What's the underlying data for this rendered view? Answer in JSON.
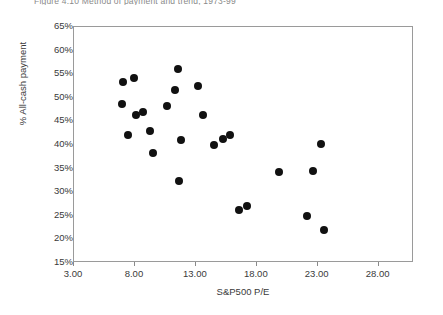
{
  "figure": {
    "title": "Figure 4.10    Method of payment and trend, 1973-99"
  },
  "chart_data": {
    "type": "scatter",
    "title": "Method of payment and trend, 1973-99",
    "xlabel": "S&P500 P/E",
    "ylabel": "% All-cash payment",
    "xlim": [
      3.0,
      30.9
    ],
    "ylim": [
      15,
      65
    ],
    "grid": false,
    "legend": "none",
    "marker": {
      "shape": "circle",
      "color": "#111111",
      "size_px": 8
    },
    "xticks": [
      "3.00",
      "8.00",
      "13.00",
      "18.00",
      "23.00",
      "28.00"
    ],
    "xtick_values": [
      3,
      8,
      13,
      18,
      23,
      28
    ],
    "yticks": [
      "15%",
      "20%",
      "25%",
      "30%",
      "35%",
      "40%",
      "45%",
      "50%",
      "55%",
      "60%",
      "65%"
    ],
    "ytick_values": [
      15,
      20,
      25,
      30,
      35,
      40,
      45,
      50,
      55,
      60,
      65
    ],
    "points": [
      {
        "x": 7.0,
        "y": 53.4
      },
      {
        "x": 7.9,
        "y": 54.3
      },
      {
        "x": 6.9,
        "y": 48.7
      },
      {
        "x": 7.4,
        "y": 42.2
      },
      {
        "x": 8.1,
        "y": 46.3
      },
      {
        "x": 8.7,
        "y": 47.0
      },
      {
        "x": 9.2,
        "y": 43.0
      },
      {
        "x": 9.5,
        "y": 38.2
      },
      {
        "x": 10.6,
        "y": 48.3
      },
      {
        "x": 11.5,
        "y": 56.2
      },
      {
        "x": 11.3,
        "y": 51.6
      },
      {
        "x": 11.8,
        "y": 41.1
      },
      {
        "x": 11.6,
        "y": 32.4
      },
      {
        "x": 13.2,
        "y": 52.4
      },
      {
        "x": 13.6,
        "y": 46.3
      },
      {
        "x": 14.5,
        "y": 40.1
      },
      {
        "x": 15.2,
        "y": 41.2
      },
      {
        "x": 15.8,
        "y": 42.1
      },
      {
        "x": 16.5,
        "y": 26.2
      },
      {
        "x": 17.2,
        "y": 27.0
      },
      {
        "x": 19.8,
        "y": 34.2
      },
      {
        "x": 22.6,
        "y": 34.5
      },
      {
        "x": 22.1,
        "y": 25.0
      },
      {
        "x": 23.3,
        "y": 40.2
      },
      {
        "x": 23.5,
        "y": 22.0
      }
    ]
  }
}
